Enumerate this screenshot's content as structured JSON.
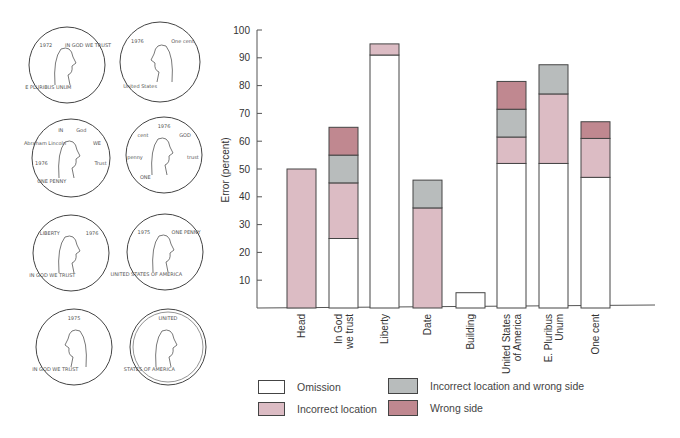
{
  "chart_data": {
    "type": "bar",
    "stacked": true,
    "title": "",
    "xlabel": "",
    "ylabel": "Error (percent)",
    "ylim": [
      0,
      100
    ],
    "yticks": [
      10,
      20,
      30,
      40,
      50,
      60,
      70,
      80,
      90,
      100
    ],
    "grid": false,
    "legend_position": "bottom",
    "categories": [
      "Head",
      "In God we trust",
      "Liberty",
      "Date",
      "Building",
      "United States of America",
      "E. Pluribus Unum",
      "One cent"
    ],
    "category_lines": [
      [
        "Head"
      ],
      [
        "In God",
        "we trust"
      ],
      [
        "Liberty"
      ],
      [
        "Date"
      ],
      [
        "Building"
      ],
      [
        "United States",
        "of America"
      ],
      [
        "E. Pluribus",
        "Unum"
      ],
      [
        "One cent"
      ]
    ],
    "series": [
      {
        "name": "Omission",
        "color": "#ffffff",
        "values": [
          0,
          25,
          91,
          0,
          5.5,
          52,
          52,
          47
        ]
      },
      {
        "name": "Incorrect location",
        "color": "#dcbcc4",
        "values": [
          50,
          20,
          4,
          36,
          0,
          9.5,
          25,
          14
        ]
      },
      {
        "name": "Incorrect location and wrong side",
        "color": "#b8bcbc",
        "values": [
          0,
          10,
          0,
          10,
          0,
          10,
          10.5,
          0
        ]
      },
      {
        "name": "Wrong side",
        "color": "#c08890",
        "values": [
          0,
          10,
          0,
          0,
          0,
          10,
          0,
          6
        ]
      }
    ]
  },
  "legend": {
    "items": [
      {
        "label": "Omission",
        "color": "#ffffff"
      },
      {
        "label": "Incorrect location",
        "color": "#dcbcc4"
      },
      {
        "label": "Incorrect location and wrong side",
        "color": "#b8bcbc"
      },
      {
        "label": "Wrong side",
        "color": "#c08890"
      }
    ]
  },
  "coins": {
    "description": "Eight hand-drawn sketches of a U.S. penny",
    "items": [
      {
        "texts": [
          "E PLURIBUS UNUM",
          "1972",
          "IN GOD WE TRUST"
        ]
      },
      {
        "texts": [
          "United States",
          "1976",
          "One cent"
        ]
      },
      {
        "texts": [
          "ONE PENNY",
          "1976",
          "Abraham Lincoln",
          "IN",
          "God",
          "WE",
          "Trust"
        ]
      },
      {
        "texts": [
          "ONE",
          "penny",
          "cent",
          "1976",
          "GOD",
          "trust"
        ]
      },
      {
        "texts": [
          "IN GOD WE TRUST",
          "LIBERTY",
          "1976"
        ]
      },
      {
        "texts": [
          "UNITED STATES OF AMERICA",
          "1975",
          "ONE PENNY"
        ]
      },
      {
        "texts": [
          "IN GOD WE TRUST",
          "1975"
        ]
      },
      {
        "texts": [
          "STATES OF AMERICA",
          "UNITED"
        ]
      }
    ]
  }
}
